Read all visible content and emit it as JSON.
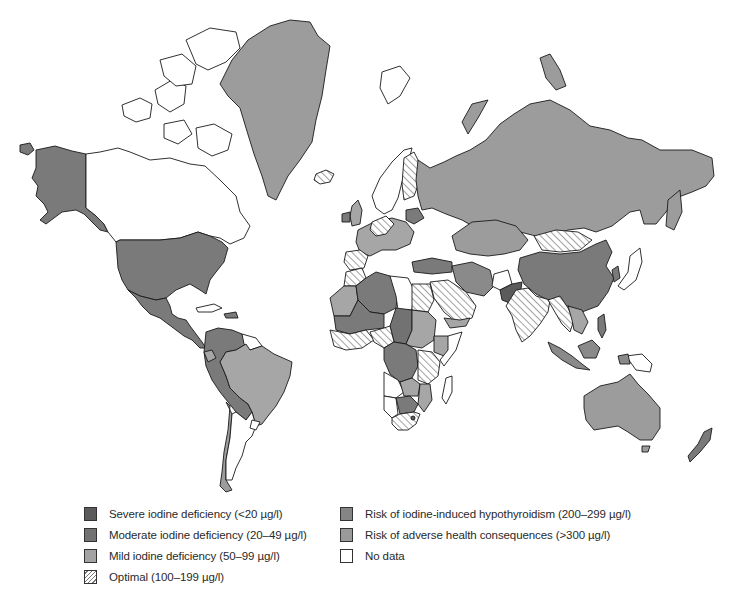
{
  "map": {
    "subject": "World map of iodine nutrition status by country (median urinary iodine)",
    "projection": "Mercator-style world outline",
    "fills": {
      "severe": "#5b5b5b",
      "moderate": "#7a7a7a",
      "mild": "#a6a6a6",
      "optimal": "hatched",
      "hypothyroidism_risk": "#8a8a8a",
      "adverse_risk": "#9c9c9c",
      "no_data": "#ffffff"
    },
    "regions": [
      {
        "name": "Alaska / USA",
        "category": "moderate"
      },
      {
        "name": "Canada",
        "category": "no_data"
      },
      {
        "name": "Greenland",
        "category": "adverse_risk"
      },
      {
        "name": "Iceland",
        "category": "optimal"
      },
      {
        "name": "Mexico & Central America",
        "category": "moderate"
      },
      {
        "name": "Brazil",
        "category": "adverse_risk"
      },
      {
        "name": "Argentina",
        "category": "no_data"
      },
      {
        "name": "Russia",
        "category": "adverse_risk"
      },
      {
        "name": "China",
        "category": "moderate"
      },
      {
        "name": "India",
        "category": "optimal"
      },
      {
        "name": "Australia",
        "category": "adverse_risk"
      },
      {
        "name": "New Zealand",
        "category": "moderate"
      },
      {
        "name": "South Africa",
        "category": "optimal"
      },
      {
        "name": "Madagascar",
        "category": "no_data"
      }
    ]
  },
  "legend": {
    "items": [
      {
        "label": "Severe iodine deficiency (<20 µg/l)",
        "swatch": "#5b5b5b"
      },
      {
        "label": "Moderate iodine deficiency (20–49 µg/l)",
        "swatch": "#727272"
      },
      {
        "label": "Mild iodine deficiency (50–99 µg/l)",
        "swatch": "#a3a3a3"
      },
      {
        "label": "Optimal (100–199 µg/l)",
        "swatch": "hatched"
      },
      {
        "label": "Risk of iodine-induced hypothyroidism (200–299 µg/l)",
        "swatch": "#858585"
      },
      {
        "label": "Risk of adverse health consequences (>300 µg/l)",
        "swatch": "#9a9a9a"
      },
      {
        "label": "No data",
        "swatch": "#ffffff"
      }
    ]
  }
}
